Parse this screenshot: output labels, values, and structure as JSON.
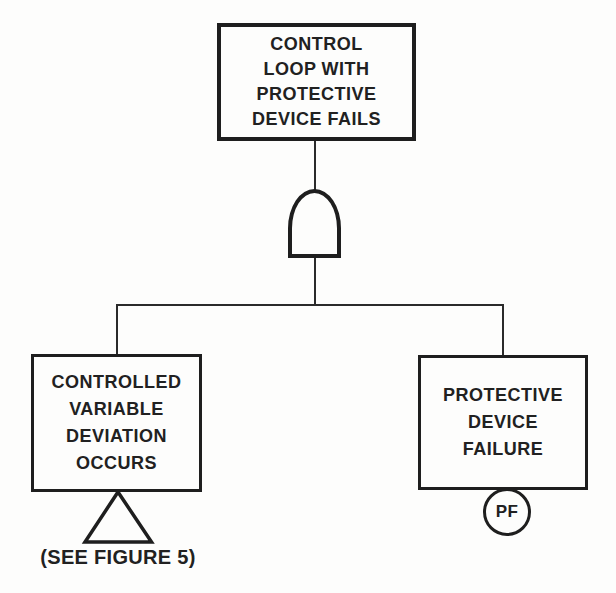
{
  "diagram": {
    "type": "fault-tree",
    "ink_color": "#1e1e1e",
    "background_color": "#fdfdfc",
    "top_event": {
      "label": "CONTROL\nLOOP WITH\nPROTECTIVE\nDEVICE FAILS"
    },
    "gate": {
      "type": "and-gate"
    },
    "left_event": {
      "label": "CONTROLLED\nVARIABLE\nDEVIATION\nOCCURS",
      "transfer_note": "(SEE FIGURE 5)"
    },
    "right_event": {
      "label": "PROTECTIVE\nDEVICE\nFAILURE",
      "basic_event_label": "PF"
    }
  }
}
